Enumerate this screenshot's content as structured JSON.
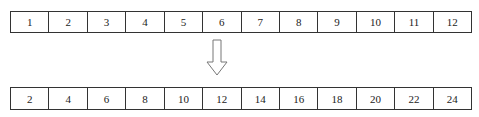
{
  "diagram": {
    "input_array": {
      "label": "input",
      "values": [
        "1",
        "2",
        "3",
        "4",
        "5",
        "6",
        "7",
        "8",
        "9",
        "10",
        "11",
        "12"
      ]
    },
    "arrow": {
      "icon": "down-arrow-icon",
      "direction": "down"
    },
    "output_array": {
      "label": "output",
      "values": [
        "2",
        "4",
        "6",
        "8",
        "10",
        "12",
        "14",
        "16",
        "18",
        "20",
        "22",
        "24"
      ]
    }
  }
}
